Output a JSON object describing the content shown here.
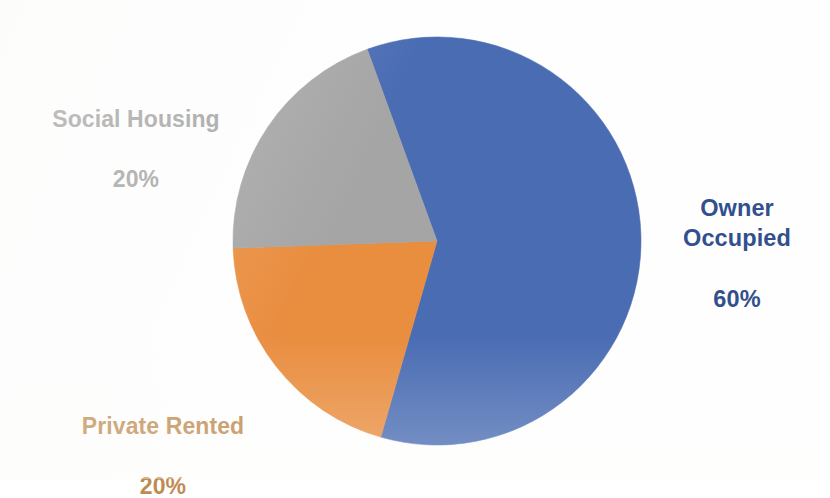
{
  "chart_data": {
    "type": "pie",
    "title": "",
    "subtitle": "",
    "xlabel": "",
    "ylabel": "",
    "legend_position": "none",
    "grid": false,
    "labels_inside": false,
    "unit": "%",
    "categories": [
      "Owner Occupied",
      "Private Rented",
      "Social Housing"
    ],
    "values": [
      60,
      20,
      20
    ],
    "colors": [
      "#4a6cb3",
      "#e98d3f",
      "#a5a5a5"
    ],
    "label_colors": [
      "#31508d",
      "#c08b50",
      "#a6a6a6"
    ],
    "start_angle_deg": -20,
    "direction": "clockwise",
    "slices": [
      {
        "name": "Owner Occupied",
        "value": 60,
        "value_text": "60%",
        "label_text": "Owner\nOccupied",
        "slice_color": "#4a6cb3",
        "label_color": "#31508d",
        "start_deg": -20,
        "end_deg": 196
      },
      {
        "name": "Private Rented",
        "value": 20,
        "value_text": "20%",
        "label_text": "Private Rented",
        "slice_color": "#e98d3f",
        "label_color": "#c08b50",
        "start_deg": 196,
        "end_deg": 268
      },
      {
        "name": "Social Housing",
        "value": 20,
        "value_text": "20%",
        "label_text": "Social Housing",
        "slice_color": "#a5a5a5",
        "label_color": "#a6a6a6",
        "start_deg": 268,
        "end_deg": 340
      }
    ],
    "geometry": {
      "center_x": 437,
      "center_y": 241,
      "radius": 204
    }
  },
  "canvas": {
    "background": "#fefefe",
    "width": 830,
    "height": 479
  }
}
